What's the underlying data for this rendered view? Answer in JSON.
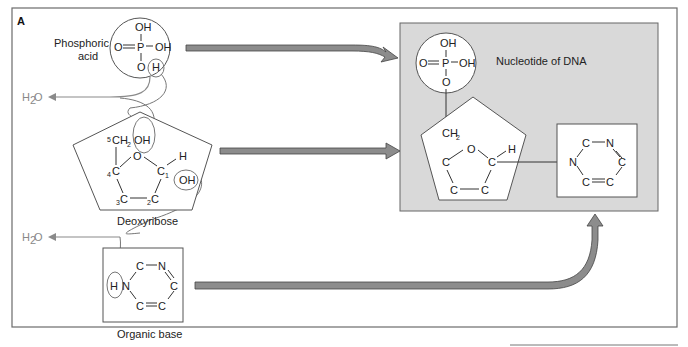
{
  "figure": {
    "panel_label": "A",
    "colors": {
      "frame": "#6b6b6b",
      "nucleotide_bg": "#d9d9d9",
      "arrow_fill": "#8c8c8c",
      "arrow_stroke": "#444444",
      "water_line": "#8a8a8a",
      "text": "#222222"
    }
  },
  "phosphoric_acid": {
    "label_line1": "Phosphoric",
    "label_line2": "acid",
    "top": "OH",
    "left": "O",
    "center": "P",
    "right": "OH",
    "bottom_o": "O",
    "bottom_h": "H"
  },
  "deoxyribose": {
    "label": "Deoxyribose",
    "c5": "CH",
    "c5_sub_num": "5",
    "c5_sub_h": "2",
    "oh_top": "OH",
    "ring_o": "O",
    "c4": "C",
    "c4_num": "4",
    "c1": "C",
    "c1_num": "1",
    "h": "H",
    "oh_right": "OH",
    "c3": "C",
    "c3_num": "3",
    "c2": "C",
    "c2_num": "2"
  },
  "organic_base": {
    "label": "Organic base",
    "h": "H",
    "n1": "N",
    "c_top": "C",
    "n_top": "N",
    "c_right": "C",
    "c_bl": "C",
    "c_br": "C"
  },
  "water": {
    "label_1": "H",
    "label_sub": "2",
    "label_2": "O"
  },
  "nucleotide": {
    "title": "Nucleotide of DNA",
    "phosphate": {
      "top": "OH",
      "left": "O",
      "center": "P",
      "right": "OH",
      "bottom": "O"
    },
    "sugar": {
      "ch": "CH",
      "ch_sub": "2",
      "o": "O",
      "c_left": "C",
      "c_right": "C",
      "h": "H",
      "c_bl": "C",
      "c_br": "C"
    },
    "base": {
      "c_top": "C",
      "n_top": "N",
      "n_left": "N",
      "c_right": "C",
      "c_bl": "C",
      "c_br": "C"
    }
  }
}
